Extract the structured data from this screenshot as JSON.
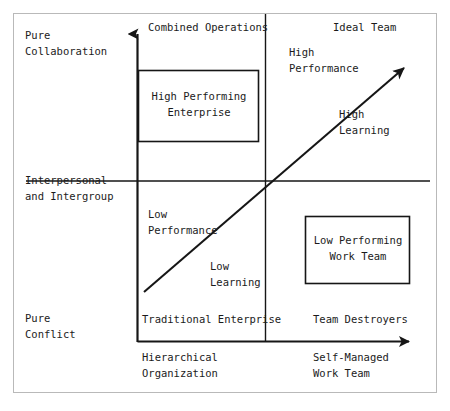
{
  "diagram": {
    "type": "two-axis-quadrant-matrix",
    "colors": {
      "ink": "#1b1b1b",
      "frame": "#b9b9b9",
      "background": "#ffffff"
    },
    "y_axis": {
      "name": "collaboration-conflict-axis",
      "top_label": "Pure\nCollaboration",
      "middle_label": "Interpersonal\nand Intergroup",
      "bottom_label": "Pure\nConflict",
      "arrow_direction": "up"
    },
    "x_axis": {
      "name": "organization-structure-axis",
      "left_label": "Hierarchical\nOrganization",
      "right_label": "Self-Managed\nWork Team",
      "arrow_direction": "right"
    },
    "quadrant_corner_labels": {
      "top_left": "Combined Operations",
      "top_right": "Ideal Team",
      "bottom_left": "Traditional Enterprise",
      "bottom_right": "Team Destroyers"
    },
    "diagonal_arrow": {
      "name": "growth-trajectory-arrow",
      "lower_left_annotations": [
        "Low\nPerformance",
        "Low\nLearning"
      ],
      "upper_right_annotations": [
        "High\nPerformance",
        "High\nLearning"
      ],
      "low_performance": "Low\nPerformance",
      "low_learning": "Low\nLearning",
      "high_performance": "High\nPerformance",
      "high_learning": "High\nLearning"
    },
    "boxes": [
      {
        "name": "high-performing-enterprise-box",
        "label": "High Performing\nEnterprise",
        "quadrant": "top_left"
      },
      {
        "name": "low-performing-work-team-box",
        "label": "Low Performing\nWork Team",
        "quadrant": "bottom_right"
      }
    ]
  }
}
